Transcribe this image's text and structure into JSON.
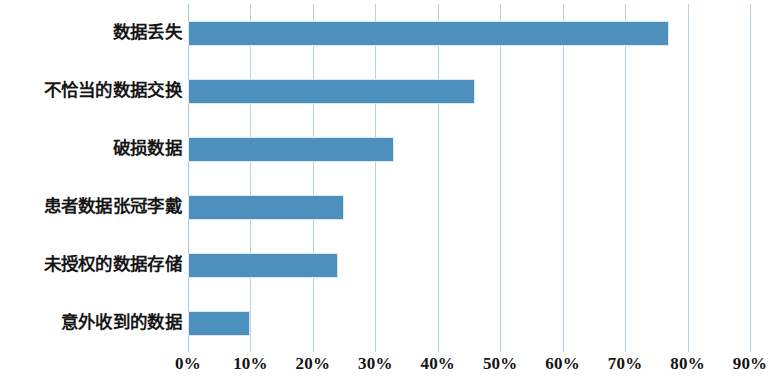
{
  "chart_data": {
    "type": "bar",
    "orientation": "horizontal",
    "title": "",
    "subtitle": "",
    "xlabel": "",
    "ylabel": "",
    "categories": [
      "数据丢失",
      "不恰当的数据交换",
      "破损数据",
      "患者数据张冠李戴",
      "未授权的数据存储",
      "意外收到的数据"
    ],
    "values": [
      77,
      46,
      33,
      25,
      24,
      10
    ],
    "value_unit": "%",
    "xlim": [
      0,
      90
    ],
    "xticks": [
      0,
      10,
      20,
      30,
      40,
      50,
      60,
      70,
      80,
      90
    ],
    "xtick_labels": [
      "0%",
      "10%",
      "20%",
      "30%",
      "40%",
      "50%",
      "60%",
      "70%",
      "80%",
      "90%"
    ],
    "grid": true,
    "grid_axis": "x",
    "legend": false,
    "legend_position": "none",
    "series": [
      {
        "name": "",
        "values": [
          77,
          46,
          33,
          25,
          24,
          10
        ]
      }
    ],
    "colors": {
      "bar": "#4d90bd",
      "bar_edge": "#dbe8f1",
      "gridline": "#b9d2e2",
      "text": "#161616",
      "background": "#ffffff"
    }
  }
}
